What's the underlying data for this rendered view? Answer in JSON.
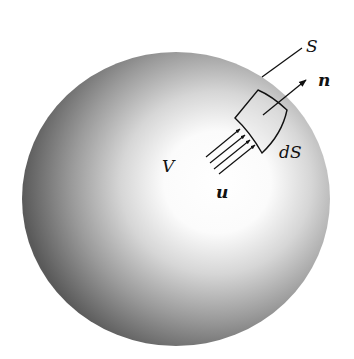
{
  "figure": {
    "labels": {
      "surface": "S",
      "normal": "n",
      "volume": "V",
      "velocity": "u",
      "surface_element": "dS"
    },
    "colors": {
      "sphere_dark": "#5a5a5a",
      "sphere_light": "#ffffff",
      "ink": "#111111"
    }
  }
}
